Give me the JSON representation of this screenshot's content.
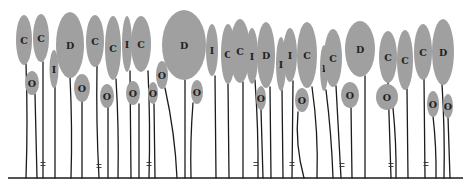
{
  "figure": {
    "width": 473,
    "height": 190,
    "baseline": {
      "x1": 8,
      "x2": 463,
      "y": 178
    },
    "colors": {
      "cell_fill": "#a0a0a0",
      "stem": "#1c1c1c",
      "label": "#222222"
    }
  },
  "cells": [
    {
      "label": "C",
      "cx": 24,
      "cy": 40,
      "rx": 8,
      "ry": 25
    },
    {
      "label": "O",
      "cx": 32,
      "cy": 83,
      "rx": 7,
      "ry": 12
    },
    {
      "label": "C",
      "cx": 41,
      "cy": 38,
      "rx": 8,
      "ry": 24
    },
    {
      "label": "I",
      "cx": 54,
      "cy": 69,
      "rx": 4.5,
      "ry": 19
    },
    {
      "label": "D",
      "cx": 70,
      "cy": 45,
      "rx": 14,
      "ry": 33
    },
    {
      "label": "O",
      "cx": 82,
      "cy": 88,
      "rx": 8,
      "ry": 14
    },
    {
      "label": "C",
      "cx": 95,
      "cy": 41,
      "rx": 9,
      "ry": 26
    },
    {
      "label": "O",
      "cx": 107,
      "cy": 96,
      "rx": 7,
      "ry": 12
    },
    {
      "label": "C",
      "cx": 113,
      "cy": 48,
      "rx": 8,
      "ry": 32
    },
    {
      "label": "I",
      "cx": 127,
      "cy": 44,
      "rx": 5,
      "ry": 28
    },
    {
      "label": "O",
      "cx": 133,
      "cy": 93,
      "rx": 7,
      "ry": 12
    },
    {
      "label": "C",
      "cx": 141,
      "cy": 44,
      "rx": 10,
      "ry": 28
    },
    {
      "label": "O",
      "cx": 153,
      "cy": 93,
      "rx": 5,
      "ry": 11
    },
    {
      "label": "O",
      "cx": 162,
      "cy": 75,
      "rx": 6,
      "ry": 14
    },
    {
      "label": "D",
      "cx": 184,
      "cy": 45,
      "rx": 22,
      "ry": 35
    },
    {
      "label": "O",
      "cx": 197,
      "cy": 92,
      "rx": 6,
      "ry": 12
    },
    {
      "label": "I",
      "cx": 212,
      "cy": 50,
      "rx": 6,
      "ry": 26
    },
    {
      "label": "C",
      "cx": 228,
      "cy": 54,
      "rx": 7,
      "ry": 30
    },
    {
      "label": "C",
      "cx": 240,
      "cy": 51,
      "rx": 10,
      "ry": 32
    },
    {
      "label": "I",
      "cx": 252,
      "cy": 56,
      "rx": 6,
      "ry": 28
    },
    {
      "label": "O",
      "cx": 261,
      "cy": 98,
      "rx": 5,
      "ry": 12
    },
    {
      "label": "D",
      "cx": 266,
      "cy": 55,
      "rx": 9,
      "ry": 33
    },
    {
      "label": "I",
      "cx": 281,
      "cy": 64,
      "rx": 5,
      "ry": 27
    },
    {
      "label": "I",
      "cx": 290,
      "cy": 55,
      "rx": 7,
      "ry": 27
    },
    {
      "label": "O",
      "cx": 302,
      "cy": 100,
      "rx": 7,
      "ry": 12
    },
    {
      "label": "C",
      "cx": 307,
      "cy": 55,
      "rx": 10,
      "ry": 33
    },
    {
      "label": "I",
      "cx": 324,
      "cy": 68,
      "rx": 4,
      "ry": 23
    },
    {
      "label": "C",
      "cx": 333,
      "cy": 58,
      "rx": 9,
      "ry": 29
    },
    {
      "label": "O",
      "cx": 350,
      "cy": 95,
      "rx": 9,
      "ry": 13
    },
    {
      "label": "D",
      "cx": 360,
      "cy": 49,
      "rx": 15,
      "ry": 28
    },
    {
      "label": "C",
      "cx": 388,
      "cy": 57,
      "rx": 9,
      "ry": 26
    },
    {
      "label": "O",
      "cx": 387,
      "cy": 97,
      "rx": 11,
      "ry": 13
    },
    {
      "label": "C",
      "cx": 405,
      "cy": 60,
      "rx": 8,
      "ry": 30
    },
    {
      "label": "C",
      "cx": 423,
      "cy": 52,
      "rx": 9,
      "ry": 28
    },
    {
      "label": "O",
      "cx": 433,
      "cy": 104,
      "rx": 6,
      "ry": 13
    },
    {
      "label": "D",
      "cx": 443,
      "cy": 52,
      "rx": 11,
      "ry": 33
    },
    {
      "label": "O",
      "cx": 448,
      "cy": 106,
      "rx": 5,
      "ry": 12
    }
  ],
  "stems": [
    {
      "x_top": 26,
      "y_top": 64,
      "x_bottom": 26,
      "bend": 1
    },
    {
      "x_top": 35,
      "y_top": 94,
      "x_bottom": 37,
      "bend": 0
    },
    {
      "x_top": 43,
      "y_top": 62,
      "x_bottom": 43,
      "bend": 0
    },
    {
      "x_top": 55,
      "y_top": 87,
      "x_bottom": 55,
      "bend": 0
    },
    {
      "x_top": 70,
      "y_top": 77,
      "x_bottom": 71,
      "bend": 1
    },
    {
      "x_top": 82,
      "y_top": 101,
      "x_bottom": 82,
      "bend": 0
    },
    {
      "x_top": 97,
      "y_top": 66,
      "x_bottom": 99,
      "bend": -1
    },
    {
      "x_top": 108,
      "y_top": 107,
      "x_bottom": 108,
      "bend": 0
    },
    {
      "x_top": 116,
      "y_top": 79,
      "x_bottom": 118,
      "bend": 1
    },
    {
      "x_top": 130,
      "y_top": 71,
      "x_bottom": 131,
      "bend": 0
    },
    {
      "x_top": 139,
      "y_top": 104,
      "x_bottom": 139,
      "bend": 0
    },
    {
      "x_top": 148,
      "y_top": 71,
      "x_bottom": 149,
      "bend": 1
    },
    {
      "x_top": 154,
      "y_top": 104,
      "x_bottom": 155,
      "bend": 0
    },
    {
      "x_top": 165,
      "y_top": 88,
      "x_bottom": 177,
      "bend": 2
    },
    {
      "x_top": 185,
      "y_top": 80,
      "x_bottom": 185,
      "bend": 0
    },
    {
      "x_top": 193,
      "y_top": 103,
      "x_bottom": 191,
      "bend": -1
    },
    {
      "x_top": 215,
      "y_top": 76,
      "x_bottom": 216,
      "bend": 0
    },
    {
      "x_top": 228,
      "y_top": 84,
      "x_bottom": 229,
      "bend": 0
    },
    {
      "x_top": 243,
      "y_top": 82,
      "x_bottom": 243,
      "bend": 0
    },
    {
      "x_top": 255,
      "y_top": 80,
      "x_bottom": 258,
      "bend": 1
    },
    {
      "x_top": 261,
      "y_top": 109,
      "x_bottom": 263,
      "bend": 0
    },
    {
      "x_top": 270,
      "y_top": 87,
      "x_bottom": 271,
      "bend": 0
    },
    {
      "x_top": 282,
      "y_top": 90,
      "x_bottom": 283,
      "bend": 0
    },
    {
      "x_top": 293,
      "y_top": 81,
      "x_bottom": 292,
      "bend": 0
    },
    {
      "x_top": 298,
      "y_top": 112,
      "x_bottom": 304,
      "bend": -3
    },
    {
      "x_top": 312,
      "y_top": 87,
      "x_bottom": 317,
      "bend": 2
    },
    {
      "x_top": 326,
      "y_top": 90,
      "x_bottom": 333,
      "bend": 1
    },
    {
      "x_top": 336,
      "y_top": 86,
      "x_bottom": 341,
      "bend": 0
    },
    {
      "x_top": 351,
      "y_top": 107,
      "x_bottom": 352,
      "bend": 0
    },
    {
      "x_top": 365,
      "y_top": 76,
      "x_bottom": 365,
      "bend": 0
    },
    {
      "x_top": 388,
      "y_top": 82,
      "x_bottom": 391,
      "bend": 0
    },
    {
      "x_top": 393,
      "y_top": 108,
      "x_bottom": 396,
      "bend": 1
    },
    {
      "x_top": 407,
      "y_top": 89,
      "x_bottom": 408,
      "bend": 0
    },
    {
      "x_top": 424,
      "y_top": 79,
      "x_bottom": 425,
      "bend": 0
    },
    {
      "x_top": 433,
      "y_top": 116,
      "x_bottom": 436,
      "bend": 1
    },
    {
      "x_top": 442,
      "y_top": 84,
      "x_bottom": 444,
      "bend": 1
    },
    {
      "x_top": 448,
      "y_top": 117,
      "x_bottom": 450,
      "bend": 0
    }
  ],
  "markers": [
    {
      "x": 43,
      "y": 164
    },
    {
      "x": 99,
      "y": 166
    },
    {
      "x": 149,
      "y": 164
    },
    {
      "x": 256,
      "y": 164
    },
    {
      "x": 292,
      "y": 164
    },
    {
      "x": 342,
      "y": 165
    },
    {
      "x": 391,
      "y": 165
    },
    {
      "x": 426,
      "y": 164
    }
  ]
}
